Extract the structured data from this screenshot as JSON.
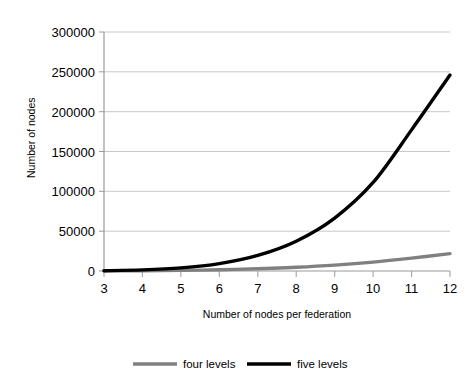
{
  "figure": {
    "top_clipped_caption": "· · ·  ·  ·  ·   ·      ·"
  },
  "chart_data": {
    "type": "line",
    "title": "",
    "xlabel": "Number of nodes per federation",
    "ylabel": "Number of nodes",
    "x": [
      3,
      4,
      5,
      6,
      7,
      8,
      9,
      10,
      11,
      12
    ],
    "xlim": [
      3,
      12
    ],
    "ylim": [
      0,
      300000
    ],
    "yticks": [
      0,
      50000,
      100000,
      150000,
      200000,
      250000,
      300000
    ],
    "ytick_labels": [
      "0",
      "50000",
      "100000",
      "150000",
      "200000",
      "250000",
      "300000"
    ],
    "xtick_labels": [
      "3",
      "4",
      "5",
      "6",
      "7",
      "8",
      "9",
      "10",
      "11",
      "12"
    ],
    "grid": "horizontal",
    "legend_position": "bottom",
    "series": [
      {
        "name": "four levels",
        "color": "#808080",
        "values": [
          120,
          341,
          781,
          1555,
          2801,
          4681,
          7381,
          11111,
          16105,
          21844
        ]
      },
      {
        "name": "five levels",
        "color": "#000000",
        "values": [
          364,
          1365,
          3906,
          9331,
          19608,
          37449,
          66430,
          111111,
          177156,
          246000
        ]
      }
    ]
  },
  "legend": {
    "items": [
      {
        "label": "four levels",
        "color": "#808080"
      },
      {
        "label": "five levels",
        "color": "#000000"
      }
    ]
  }
}
